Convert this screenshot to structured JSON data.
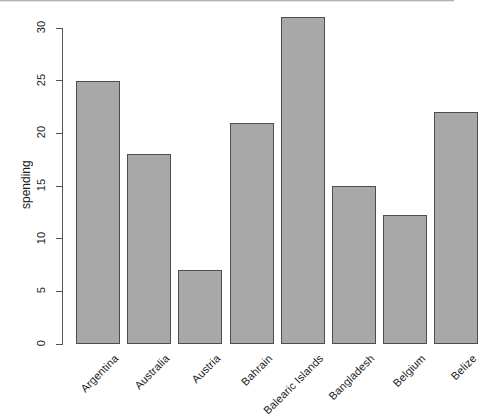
{
  "chart_data": {
    "type": "bar",
    "title": "",
    "subtitle": "",
    "xlabel": "",
    "ylabel": "spending",
    "categories": [
      "Argentina",
      "Australia",
      "Austria",
      "Bahrain",
      "Balearic Islands",
      "Bangladesh",
      "Belgium",
      "Belize"
    ],
    "values": [
      25,
      18,
      7,
      21,
      31,
      15,
      12.2,
      22
    ],
    "ylim": [
      0,
      30
    ],
    "yticks": [
      0,
      5,
      10,
      15,
      20,
      25,
      30
    ],
    "ytick_labels": [
      "0",
      "5",
      "10",
      "15",
      "20",
      "25",
      "30"
    ],
    "grid": false,
    "legend": null,
    "bar_color": "#a8a8a8",
    "bar_border_color": "#4d4d4d",
    "axis_color": "#555555",
    "background": "#ffffff",
    "xtick_label_rotation": -45,
    "ytick_label_rotation": -90
  }
}
